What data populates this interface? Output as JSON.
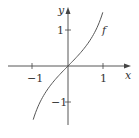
{
  "chart_data": {
    "type": "line",
    "title": "",
    "xlabel": "x",
    "ylabel": "y",
    "xlim": [
      -1.5,
      1.7
    ],
    "ylim": [
      -1.6,
      1.6
    ],
    "x_ticks": [
      -1,
      1
    ],
    "x_tick_labels": [
      "−1",
      "1"
    ],
    "y_ticks": [
      1,
      -1
    ],
    "y_tick_labels": [
      "1",
      "−1"
    ],
    "grid": false,
    "series": [
      {
        "name": "f",
        "label": "f",
        "x": [
          -0.98,
          -0.8,
          -0.6,
          -0.4,
          -0.2,
          0,
          0.2,
          0.4,
          0.6,
          0.8,
          0.98
        ],
        "values": [
          -1.49,
          -1.03,
          -0.68,
          -0.42,
          -0.2,
          0,
          0.2,
          0.42,
          0.68,
          1.03,
          1.49
        ]
      }
    ],
    "annotations": [
      "f"
    ]
  },
  "labels": {
    "x_axis": "x",
    "y_axis": "y",
    "curve": "f",
    "x_neg1": "−1",
    "x_pos1": "1",
    "y_pos1": "1",
    "y_neg1": "−1"
  },
  "colors": {
    "axis": "#444444",
    "curve": "#555555",
    "text": "#333333"
  }
}
